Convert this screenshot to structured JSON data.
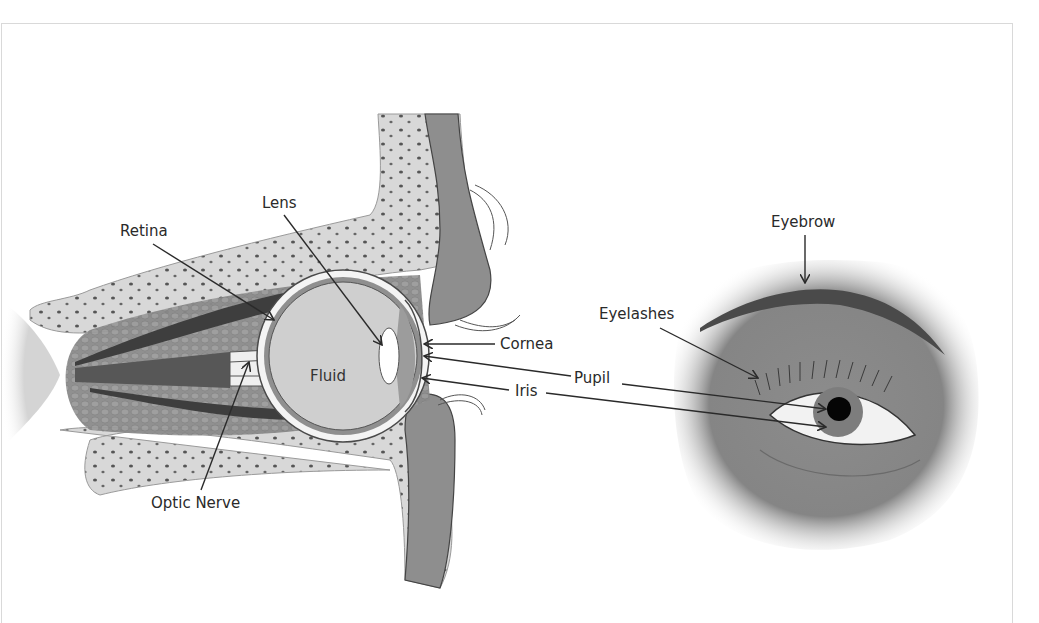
{
  "diagram": {
    "type": "anatomy-illustration",
    "cross_section": {
      "labels": {
        "lens": "Lens",
        "retina": "Retina",
        "fluid": "Fluid",
        "cornea": "Cornea",
        "pupil": "Pupil",
        "iris": "Iris",
        "optic_nerve": "Optic Nerve"
      }
    },
    "external_view": {
      "labels": {
        "eyebrow": "Eyebrow",
        "eyelashes": "Eyelashes"
      }
    }
  },
  "colors": {
    "background": "#ffffff",
    "bone": "#d6d6d6",
    "muscle": "#6e6e6e",
    "eyeball_fill": "#cfcfcf",
    "skin": "#8a8a8a",
    "label_text": "#2a2a2a",
    "leader_line": "#2a2a2a"
  }
}
